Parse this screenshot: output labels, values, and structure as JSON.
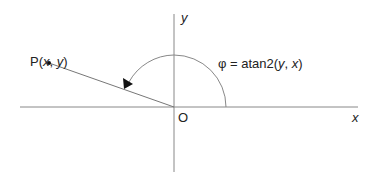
{
  "diagram": {
    "point_label": {
      "name": "P(",
      "x": "x",
      "sep": ", ",
      "y": "y",
      "close": ")"
    },
    "origin_label": "O",
    "x_axis_label": "x",
    "y_axis_label": "y",
    "angle_label": {
      "prefix": "φ = atan2(",
      "y": "y",
      "sep": ", ",
      "x": "x",
      "close": ")"
    },
    "colors": {
      "axis": "#888888",
      "line": "#777777",
      "text": "#222222",
      "arrow": "#111111"
    }
  }
}
